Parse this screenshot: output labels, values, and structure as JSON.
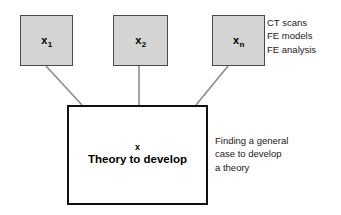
{
  "diagram": {
    "type": "flow-diagram",
    "background_color": "#ffffff",
    "node_fill_color": "#d4d4d4",
    "node_border_color": "#4a4a4a",
    "main_border_color": "#111111",
    "connector_color": "#888888",
    "input_nodes": [
      {
        "id": "x1",
        "var": "x",
        "subscript": "1",
        "x": 20,
        "y": 15,
        "w": 53,
        "h": 51
      },
      {
        "id": "x2",
        "var": "x",
        "subscript": "2",
        "x": 113,
        "y": 15,
        "w": 55,
        "h": 51
      },
      {
        "id": "xn",
        "var": "x",
        "subscript": "n",
        "x": 212,
        "y": 15,
        "w": 53,
        "h": 51
      }
    ],
    "main_node": {
      "var": "x",
      "title": "Theory to develop",
      "x": 67,
      "y": 105,
      "w": 141,
      "h": 100
    },
    "annotations": [
      {
        "id": "inputs-annotation",
        "x": 267,
        "y": 16,
        "lines": [
          "CT scans",
          "FE models",
          "FE analysis"
        ]
      },
      {
        "id": "main-annotation",
        "x": 215,
        "y": 134,
        "lines": [
          "Finding a general",
          "case to develop",
          "a theory"
        ]
      }
    ],
    "connectors": [
      {
        "id": "connector-x1",
        "x1": 46,
        "y1": 66,
        "x2": 82,
        "y2": 105
      },
      {
        "id": "connector-x2",
        "x1": 139,
        "y1": 66,
        "x2": 139,
        "y2": 105
      },
      {
        "id": "connector-xn",
        "x1": 228,
        "y1": 66,
        "x2": 196,
        "y2": 105
      }
    ]
  }
}
